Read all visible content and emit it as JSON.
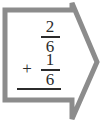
{
  "card": {
    "shape": "right-block-arrow",
    "outline_color": "#8c8c8c",
    "fill_color": "#ffffff",
    "ink_color": "#2b2b2b",
    "stroke_width": 5
  },
  "problem": {
    "type": "fraction-addition",
    "operator": "+",
    "answer_rule": true,
    "terms": [
      {
        "numerator": "2",
        "denominator": "6"
      },
      {
        "numerator": "1",
        "denominator": "6"
      }
    ],
    "expression_text": "2/6 + 1/6"
  }
}
